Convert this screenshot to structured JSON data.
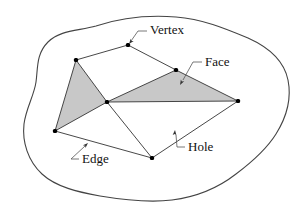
{
  "figure": {
    "kind": "polygon-mesh-topology-diagram",
    "background_color": "#ffffff",
    "stroke_color": "#333333",
    "face_fill_color": "#c8c8c8",
    "vertex_color": "#000000",
    "label_color": "#111111",
    "width": 306,
    "height": 217
  },
  "boundary": {
    "name": "surface-outline",
    "path": "M 96 26 C 120 18, 150 15, 176 17 C 202 19, 224 28, 248 38 C 268 47, 284 60, 288 80 C 292 100, 286 118, 276 134 C 266 150, 252 162, 236 174 C 218 188, 196 197, 172 200 C 148 203, 124 200, 100 196 C 78 192, 56 187, 42 174 C 28 161, 22 142, 24 124 C 26 108, 34 96, 36 82 C 38 68, 36 54, 48 42 C 60 30, 78 31, 96 26 Z"
  },
  "vertices": [
    {
      "id": "v-top-left",
      "label": "top-left vertex",
      "x": 76,
      "y": 60
    },
    {
      "id": "v-top",
      "label": "top vertex",
      "x": 128,
      "y": 45
    },
    {
      "id": "v-upper-right",
      "label": "upper-right vertex",
      "x": 176,
      "y": 70
    },
    {
      "id": "v-right",
      "label": "right vertex",
      "x": 238,
      "y": 101
    },
    {
      "id": "v-center",
      "label": "center vertex",
      "x": 107,
      "y": 102
    },
    {
      "id": "v-left",
      "label": "left vertex",
      "x": 55,
      "y": 131
    },
    {
      "id": "v-bottom",
      "label": "bottom vertex",
      "x": 152,
      "y": 158
    }
  ],
  "faces": [
    {
      "id": "face-left",
      "label": "left shaded face",
      "filled": true,
      "points": "76,60 107,102 55,131"
    },
    {
      "id": "face-right",
      "label": "right shaded face",
      "filled": true,
      "points": "176,70 238,101 107,102"
    }
  ],
  "edges": [
    {
      "id": "edge-topleft-top",
      "x1": 76,
      "y1": 60,
      "x2": 128,
      "y2": 45
    },
    {
      "id": "edge-top-upperright",
      "x1": 128,
      "y1": 45,
      "x2": 176,
      "y2": 70
    },
    {
      "id": "edge-upperright-right",
      "x1": 176,
      "y1": 70,
      "x2": 238,
      "y2": 101
    },
    {
      "id": "edge-upperright-center",
      "x1": 176,
      "y1": 70,
      "x2": 107,
      "y2": 102
    },
    {
      "id": "edge-topleft-center",
      "x1": 76,
      "y1": 60,
      "x2": 107,
      "y2": 102
    },
    {
      "id": "edge-topleft-left",
      "x1": 76,
      "y1": 60,
      "x2": 55,
      "y2": 131
    },
    {
      "id": "edge-left-center",
      "x1": 55,
      "y1": 131,
      "x2": 107,
      "y2": 102
    },
    {
      "id": "edge-center-right",
      "x1": 107,
      "y1": 102,
      "x2": 238,
      "y2": 101
    },
    {
      "id": "edge-center-bottom",
      "x1": 107,
      "y1": 102,
      "x2": 152,
      "y2": 158
    },
    {
      "id": "edge-left-bottom",
      "x1": 55,
      "y1": 131,
      "x2": 152,
      "y2": 158
    },
    {
      "id": "edge-bottom-right",
      "x1": 152,
      "y1": 158,
      "x2": 238,
      "y2": 101
    }
  ],
  "annotations": [
    {
      "id": "vertex",
      "text": "Vertex",
      "text_x": 150,
      "text_y": 34,
      "leader_path": "M 147 31 L 138 31 L 131 41",
      "arrow_x": 129,
      "arrow_y": 44,
      "arrow_angle": 128
    },
    {
      "id": "face",
      "text": "Face",
      "text_x": 205,
      "text_y": 66,
      "leader_path": "M 202 62 L 193 62 L 183 80",
      "arrow_x": 180,
      "arrow_y": 85,
      "arrow_angle": 119
    },
    {
      "id": "edge",
      "text": "Edge",
      "text_x": 82,
      "text_y": 163,
      "leader_path": "M 79 159 L 71 159 L 85 146",
      "arrow_x": 88,
      "arrow_y": 143,
      "arrow_angle": -43
    },
    {
      "id": "hole",
      "text": "Hole",
      "text_x": 188,
      "text_y": 151,
      "leader_path": "M 185 147 L 177 147 L 176 135",
      "arrow_x": 175,
      "arrow_y": 130,
      "arrow_angle": -85
    }
  ]
}
